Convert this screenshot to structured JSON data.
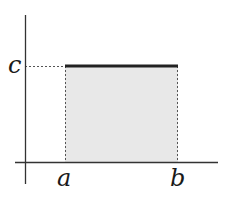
{
  "diagram": {
    "type": "uniform-distribution-rectangle",
    "labels": {
      "y_level": "c",
      "x_start": "a",
      "x_end": "b"
    },
    "colors": {
      "axis": "#333333",
      "fill": "#e8e8e8",
      "top_edge": "#222222",
      "dashed": "#555555",
      "label": "#1a1a1a"
    },
    "geometry": {
      "y_axis_x": 25,
      "y_axis_top": 15,
      "y_axis_bottom": 184,
      "x_axis_y": 162,
      "x_axis_left": 15,
      "x_axis_right": 218,
      "rect_left": 65,
      "rect_right": 178,
      "rect_top": 66
    }
  }
}
